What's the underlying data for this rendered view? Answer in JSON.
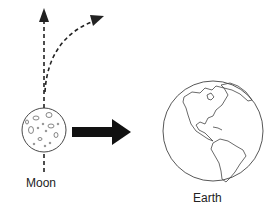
{
  "diagram": {
    "moon": {
      "label": "Moon",
      "center": [
        44,
        130
      ],
      "radius": 22
    },
    "earth": {
      "label": "Earth",
      "center": [
        213,
        131
      ],
      "radius": 50
    },
    "arrows": [
      {
        "name": "straight-path-arrow",
        "style": "dashed",
        "from": [
          44,
          170
        ],
        "to": [
          44,
          10
        ]
      },
      {
        "name": "curved-path-arrow",
        "style": "dashed",
        "from": [
          44,
          95
        ],
        "to": [
          103,
          17
        ]
      },
      {
        "name": "gravity-force-arrow",
        "style": "thick-solid",
        "from": [
          72,
          132
        ],
        "to": [
          131,
          132
        ]
      }
    ],
    "colors": {
      "stroke": "#222222",
      "background": "#ffffff"
    }
  }
}
